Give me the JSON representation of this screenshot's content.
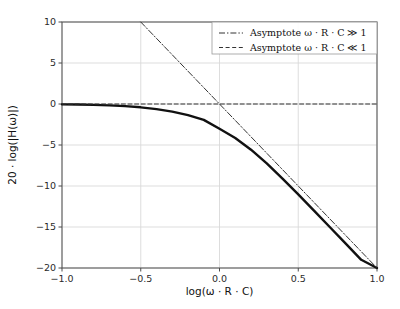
{
  "figure": {
    "background_color": "#ffffff",
    "axes_color": "#4d4d4d",
    "grid_color": "#d9d9d9",
    "curve_color": "#111111",
    "asymptote_color": "#333333"
  },
  "chart_data": {
    "type": "line",
    "title": "",
    "xlabel": "log(ω · R · C)",
    "ylabel": "20 · log(|H(ω)|)",
    "xlim": [
      -1.0,
      1.0
    ],
    "ylim": [
      -20,
      10
    ],
    "grid": true,
    "legend_position": "upper right",
    "xticks": [
      -1.0,
      -0.5,
      0.0,
      0.5,
      1.0
    ],
    "xticklabels": [
      "−1.0",
      "−0.5",
      "0.0",
      "0.5",
      "1.0"
    ],
    "yticks": [
      10,
      5,
      0,
      -5,
      -10,
      -15,
      -20
    ],
    "yticklabels": [
      "10",
      "5",
      "0",
      "−5",
      "−10",
      "−15",
      "−20"
    ],
    "series": [
      {
        "name": "Magnitude response",
        "style": "solid",
        "linewidth": 2.4,
        "color": "#111111",
        "in_legend": false,
        "formula": "20*log10(1/sqrt(1+(10^x)^2))",
        "x": [
          -1.0,
          -0.9,
          -0.8,
          -0.7,
          -0.6,
          -0.5,
          -0.4,
          -0.3,
          -0.2,
          -0.1,
          0.0,
          0.1,
          0.2,
          0.3,
          0.4,
          0.5,
          0.6,
          0.7,
          0.8,
          0.9,
          1.0
        ],
        "values": [
          -0.043,
          -0.068,
          -0.107,
          -0.168,
          -0.262,
          -0.405,
          -0.619,
          -0.93,
          -1.36,
          -1.93,
          -3.01,
          -4.14,
          -5.57,
          -7.25,
          -9.09,
          -11.03,
          -13.01,
          -15.0,
          -17.0,
          -19.0,
          -20.04
        ]
      },
      {
        "name": "Asymptote ω · R · C ≫ 1",
        "style": "dashdot",
        "linewidth": 1.0,
        "color": "#333333",
        "in_legend": true,
        "formula": "-20*x",
        "x": [
          -0.5,
          1.0
        ],
        "values": [
          10,
          -20
        ]
      },
      {
        "name": "Asymptote ω · R · C ≪ 1",
        "style": "dashed",
        "linewidth": 1.0,
        "color": "#333333",
        "in_legend": true,
        "formula": "0",
        "x": [
          -1.0,
          1.0
        ],
        "values": [
          0,
          0
        ]
      }
    ],
    "legend": [
      {
        "label": "Asymptote ω · R · C ≫ 1",
        "style": "dashdot"
      },
      {
        "label": "Asymptote ω · R · C ≪ 1",
        "style": "dashed"
      }
    ]
  }
}
